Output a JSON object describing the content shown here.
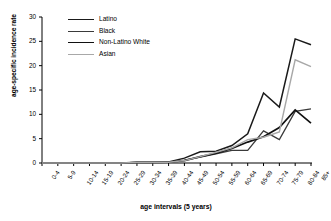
{
  "chart_data": {
    "type": "line",
    "title": "",
    "xlabel": "age intervals (5 years)",
    "ylabel": "age-specific incidence rate",
    "categories": [
      "0-4",
      "5-9",
      "10-14",
      "15-19",
      "20-24",
      "25-29",
      "30-34",
      "35-39",
      "40-44",
      "45-49",
      "50-54",
      "55-59",
      "60-64",
      "65-69",
      "70-74",
      "75-79",
      "80-84",
      "85+"
    ],
    "ylim": [
      0,
      30
    ],
    "yticks": [
      0,
      5,
      10,
      15,
      20,
      25,
      30
    ],
    "grid": false,
    "legend_position": "top-center",
    "series": [
      {
        "name": "Latino",
        "color": "#1a1a1a",
        "width": 1.5,
        "values": [
          0,
          0,
          0,
          0,
          0,
          0,
          0.15,
          0.15,
          0.2,
          1.0,
          2.3,
          2.4,
          3.6,
          6.0,
          14.4,
          11.5,
          25.5,
          24.3
        ]
      },
      {
        "name": "Black",
        "color": "#3a3a3a",
        "width": 1.3,
        "values": [
          0,
          0,
          0,
          0,
          0,
          0,
          0.1,
          0.1,
          0.15,
          0.6,
          1.2,
          1.9,
          2.6,
          2.6,
          6.6,
          4.8,
          10.6,
          11.1
        ]
      },
      {
        "name": "Non-Latino White",
        "color": "#111111",
        "width": 1.7,
        "values": [
          0,
          0,
          0,
          0,
          0,
          0,
          0.1,
          0.1,
          0.15,
          0.5,
          1.3,
          2.0,
          3.0,
          4.3,
          5.4,
          7.3,
          10.9,
          8.2
        ]
      },
      {
        "name": "Asian",
        "color": "#a8a8a8",
        "width": 1.4,
        "values": [
          0,
          0,
          0,
          0,
          0,
          0,
          0.1,
          0.1,
          0.15,
          0.5,
          1.3,
          2.2,
          3.1,
          4.8,
          5.3,
          6.4,
          21.2,
          19.8
        ]
      }
    ]
  },
  "axes": {
    "y_tick_labels": [
      "0",
      "5",
      "10",
      "15",
      "20",
      "25",
      "30"
    ],
    "x_tick_labels": [
      "0-4",
      "5-9",
      "10-14",
      "15-19",
      "20-24",
      "25-29",
      "30-34",
      "35-39",
      "40-44",
      "45-49",
      "50-54",
      "55-59",
      "60-64",
      "65-69",
      "70-74",
      "75-79",
      "80-84",
      "85+"
    ]
  }
}
